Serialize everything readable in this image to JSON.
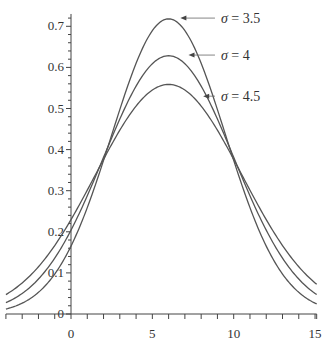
{
  "chart_data": {
    "type": "line",
    "title": "",
    "xlabel": "",
    "ylabel": "",
    "xlim": [
      -4,
      15.1
    ],
    "ylim": [
      0,
      0.73
    ],
    "grid": false,
    "legend_position": "annotations-right-of-peaks",
    "x_ticks": [
      0,
      5,
      10,
      15
    ],
    "x_tick_labels": [
      "0",
      "5",
      "10",
      "15"
    ],
    "x_minor_step": 1,
    "y_ticks": [
      0,
      0.1,
      0.2,
      0.3,
      0.4,
      0.5,
      0.6,
      0.7
    ],
    "y_tick_labels": [
      "0",
      "0.1",
      "0.2",
      "0.3",
      "0.4",
      "0.5",
      "0.6",
      "0.7"
    ],
    "y_minor_step": 0.02,
    "series": [
      {
        "name": "σ = 3.5",
        "mean": 6,
        "sigma": 3.5,
        "scale": 6.3,
        "peak": 0.72,
        "label_x": 10.2,
        "label_y": 0.72,
        "arrow_to_x": 6.6
      },
      {
        "name": "σ = 4",
        "mean": 6,
        "sigma": 4,
        "scale": 6.3,
        "peak": 0.63,
        "label_x": 10.2,
        "label_y": 0.63,
        "arrow_to_x": 7.1
      },
      {
        "name": "σ = 4.5",
        "mean": 6,
        "sigma": 4.5,
        "scale": 6.3,
        "peak": 0.56,
        "label_x": 10.2,
        "label_y": 0.53,
        "arrow_to_x": 8.0
      }
    ],
    "sampled_points": {
      "x": [
        -4,
        -2,
        0,
        2,
        4,
        6,
        8,
        10,
        12,
        14,
        15
      ],
      "sigma_3.5": [
        0.02,
        0.05,
        0.16,
        0.38,
        0.61,
        0.72,
        0.61,
        0.38,
        0.16,
        0.05,
        0.02
      ],
      "sigma_4": [
        0.03,
        0.08,
        0.2,
        0.38,
        0.56,
        0.63,
        0.56,
        0.38,
        0.2,
        0.08,
        0.05
      ],
      "sigma_4.5": [
        0.05,
        0.11,
        0.23,
        0.38,
        0.5,
        0.56,
        0.5,
        0.38,
        0.23,
        0.11,
        0.07
      ]
    }
  },
  "plot": {
    "width": 332,
    "height": 354,
    "origin_px": [
      71,
      314
    ],
    "px_per_x": 16.27,
    "px_per_y": 411
  }
}
